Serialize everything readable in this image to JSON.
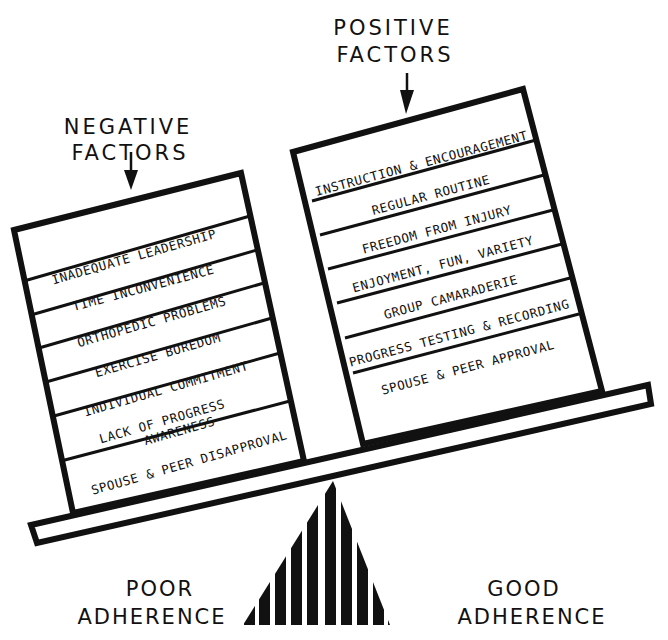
{
  "negative": {
    "title_line1": "NEGATIVE",
    "title_line2": "FACTORS",
    "items": [
      "INADEQUATE  LEADERSHIP",
      "TIME INCONVENIENCE",
      "ORTHOPEDIC PROBLEMS",
      "EXERCISE BOREDOM",
      "INDIVIDUAL COMMITMENT",
      "LACK OF PROGRESS",
      "AWARENESS",
      "SPOUSE & PEER DISAPPROVAL"
    ]
  },
  "positive": {
    "title_line1": "POSITIVE",
    "title_line2": "FACTORS",
    "items": [
      "INSTRUCTION & ENCOURAGEMENT",
      "REGULAR ROUTINE",
      "FREEDOM FROM INJURY",
      "ENJOYMENT, FUN, VARIETY",
      "GROUP CAMARADERIE",
      "PROGRESS TESTING & RECORDING",
      "SPOUSE & PEER APPROVAL"
    ]
  },
  "scale": {
    "left_label_line1": "POOR",
    "left_label_line2": "ADHERENCE",
    "right_label_line1": "GOOD",
    "right_label_line2": "ADHERENCE"
  },
  "colors": {
    "ink": "#111111",
    "paper": "#ffffff"
  }
}
